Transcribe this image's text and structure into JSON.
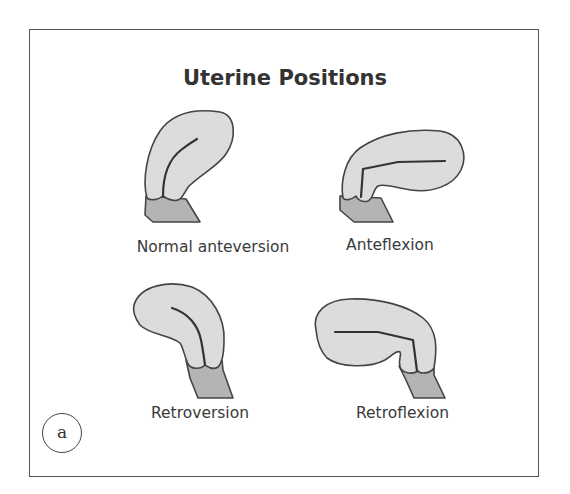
{
  "title": "Uterine Positions",
  "panel_marker": "a",
  "colors": {
    "uterus_fill": "#dcdcdc",
    "cervix_fill": "#b4b4b4",
    "outline": "#444444",
    "canal": "#3a3a3a",
    "text": "#333333",
    "frame": "#555555"
  },
  "positions": [
    {
      "id": "normal-anteversion",
      "label": "Normal anteversion"
    },
    {
      "id": "anteflexion",
      "label": "Anteflexion"
    },
    {
      "id": "retroversion",
      "label": "Retroversion"
    },
    {
      "id": "retroflexion",
      "label": "Retroflexion"
    }
  ]
}
